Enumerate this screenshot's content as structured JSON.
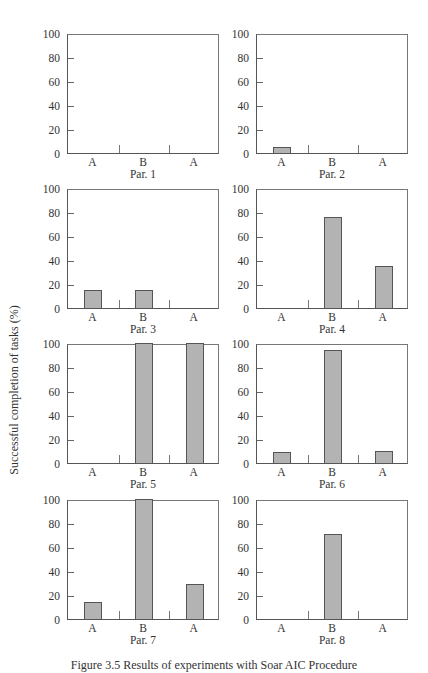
{
  "chart_data": [
    {
      "type": "bar",
      "title": "Par. 1",
      "categories": [
        "A",
        "B",
        "A"
      ],
      "values": [
        0,
        0,
        0
      ],
      "ylim": [
        0,
        100
      ],
      "yticks": [
        0,
        20,
        40,
        60,
        80,
        100
      ]
    },
    {
      "type": "bar",
      "title": "Par. 2",
      "categories": [
        "A",
        "B",
        "A"
      ],
      "values": [
        5,
        0,
        0
      ],
      "ylim": [
        0,
        100
      ],
      "yticks": [
        0,
        20,
        40,
        60,
        80,
        100
      ]
    },
    {
      "type": "bar",
      "title": "Par. 3",
      "categories": [
        "A",
        "B",
        "A"
      ],
      "values": [
        15,
        15,
        0
      ],
      "ylim": [
        0,
        100
      ],
      "yticks": [
        0,
        20,
        40,
        60,
        80,
        100
      ]
    },
    {
      "type": "bar",
      "title": "Par. 4",
      "categories": [
        "A",
        "B",
        "A"
      ],
      "values": [
        0,
        76,
        35
      ],
      "ylim": [
        0,
        100
      ],
      "yticks": [
        0,
        20,
        40,
        60,
        80,
        100
      ]
    },
    {
      "type": "bar",
      "title": "Par. 5",
      "categories": [
        "A",
        "B",
        "A"
      ],
      "values": [
        0,
        100,
        100
      ],
      "ylim": [
        0,
        100
      ],
      "yticks": [
        0,
        20,
        40,
        60,
        80,
        100
      ]
    },
    {
      "type": "bar",
      "title": "Par. 6",
      "categories": [
        "A",
        "B",
        "A"
      ],
      "values": [
        9,
        94,
        10
      ],
      "ylim": [
        0,
        100
      ],
      "yticks": [
        0,
        20,
        40,
        60,
        80,
        100
      ]
    },
    {
      "type": "bar",
      "title": "Par. 7",
      "categories": [
        "A",
        "B",
        "A"
      ],
      "values": [
        14,
        100,
        29
      ],
      "ylim": [
        0,
        100
      ],
      "yticks": [
        0,
        20,
        40,
        60,
        80,
        100
      ]
    },
    {
      "type": "bar",
      "title": "Par. 8",
      "categories": [
        "A",
        "B",
        "A"
      ],
      "values": [
        0,
        71,
        0
      ],
      "ylim": [
        0,
        100
      ],
      "yticks": [
        0,
        20,
        40,
        60,
        80,
        100
      ]
    }
  ],
  "ylabel": "Successful completion of tasks (%)",
  "caption": "Figure 3.5  Results of experiments with Soar AIC Procedure",
  "colors": {
    "bar": "#b3b3b3",
    "bar_border": "#555555",
    "axis": "#555555"
  }
}
